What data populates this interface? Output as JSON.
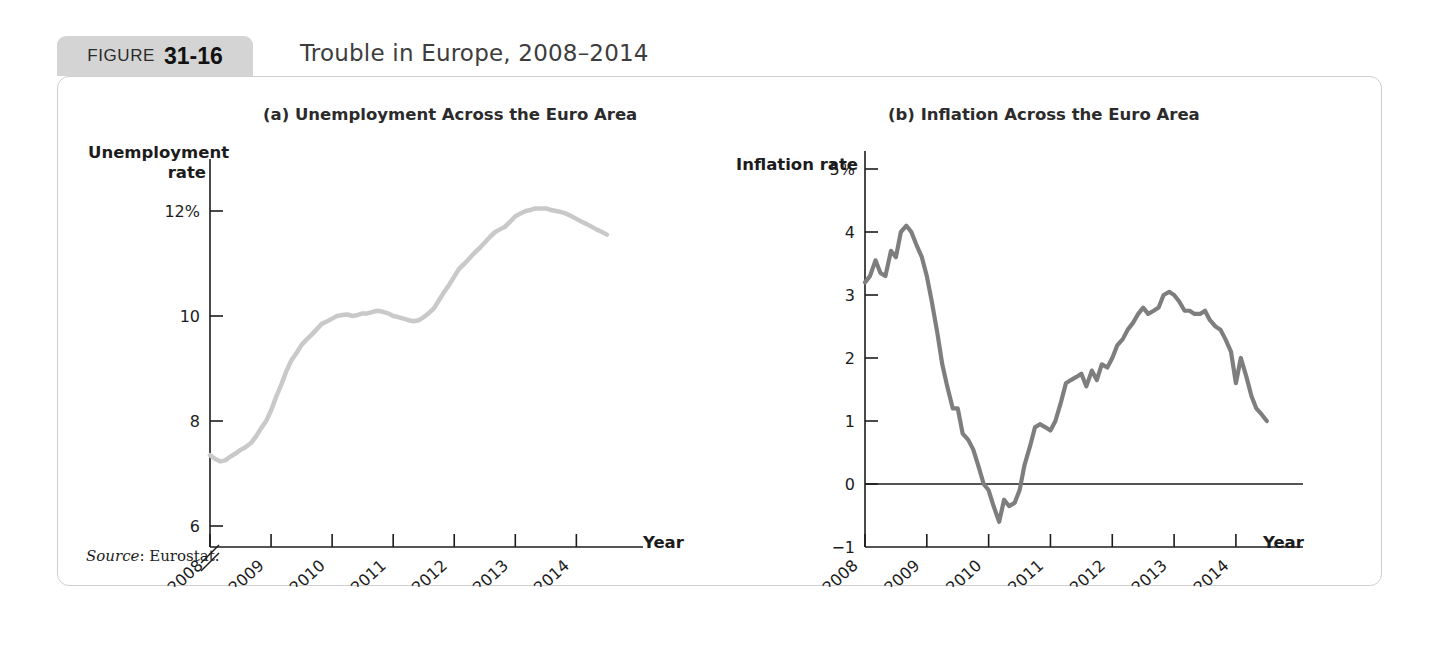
{
  "figure": {
    "badge_word": "FIGURE",
    "badge_number": "31-16",
    "title": "Trouble in Europe, 2008–2014",
    "source": "Source",
    "source_text": ": Eurostat."
  },
  "panels": {
    "a": {
      "title": "(a) Unemployment Across the Euro Area",
      "ylabel_line1": "Unemployment",
      "ylabel_line2": "rate",
      "xlabel": "Year"
    },
    "b": {
      "title": "(b) Inflation Across the Euro Area",
      "ylabel": "Inflation rate",
      "xlabel": "Year"
    }
  },
  "colors": {
    "unemployment_line": "#c9c9c9",
    "inflation_line": "#7e7e7e",
    "axis": "#1c1c1c",
    "badge_bg": "#d4d4d4",
    "card_border": "#cfcfcf"
  },
  "chart_data": [
    {
      "type": "line",
      "title": "(a) Unemployment Across the Euro Area",
      "xlabel": "Year",
      "ylabel": "Unemployment rate",
      "grid": false,
      "legend": "none",
      "y_axis_break": true,
      "ylim": [
        5.6,
        12.8
      ],
      "xlim": [
        2008.0,
        2014.6
      ],
      "yticks": [
        6,
        8,
        10,
        12
      ],
      "ytick_labels": [
        "6",
        "8",
        "10",
        "12%"
      ],
      "xticks": [
        2008,
        2009,
        2010,
        2011,
        2012,
        2013,
        2014
      ],
      "xtick_labels": [
        "2008",
        "2009",
        "2010",
        "2011",
        "2012",
        "2013",
        "2014"
      ],
      "series": [
        {
          "name": "Euro area unemployment rate",
          "color": "#c9c9c9",
          "x": [
            2008.0,
            2008.08,
            2008.17,
            2008.25,
            2008.33,
            2008.42,
            2008.5,
            2008.58,
            2008.67,
            2008.75,
            2008.83,
            2008.92,
            2009.0,
            2009.08,
            2009.17,
            2009.25,
            2009.33,
            2009.42,
            2009.5,
            2009.58,
            2009.67,
            2009.75,
            2009.83,
            2009.92,
            2010.0,
            2010.08,
            2010.17,
            2010.25,
            2010.33,
            2010.42,
            2010.5,
            2010.58,
            2010.67,
            2010.75,
            2010.83,
            2010.92,
            2011.0,
            2011.08,
            2011.17,
            2011.25,
            2011.33,
            2011.42,
            2011.5,
            2011.58,
            2011.67,
            2011.75,
            2011.83,
            2011.92,
            2012.0,
            2012.08,
            2012.17,
            2012.25,
            2012.33,
            2012.42,
            2012.5,
            2012.58,
            2012.67,
            2012.75,
            2012.83,
            2012.92,
            2013.0,
            2013.08,
            2013.17,
            2013.25,
            2013.33,
            2013.42,
            2013.5,
            2013.58,
            2013.67,
            2013.75,
            2013.83,
            2013.92,
            2014.0,
            2014.08,
            2014.17,
            2014.25,
            2014.33,
            2014.42,
            2014.5
          ],
          "y": [
            7.35,
            7.28,
            7.23,
            7.25,
            7.32,
            7.38,
            7.45,
            7.5,
            7.58,
            7.7,
            7.85,
            8.0,
            8.2,
            8.45,
            8.7,
            8.95,
            9.15,
            9.3,
            9.45,
            9.55,
            9.65,
            9.75,
            9.85,
            9.9,
            9.95,
            10.0,
            10.02,
            10.03,
            10.0,
            10.02,
            10.05,
            10.05,
            10.08,
            10.1,
            10.08,
            10.05,
            10.0,
            9.98,
            9.95,
            9.92,
            9.9,
            9.92,
            9.98,
            10.05,
            10.15,
            10.3,
            10.45,
            10.6,
            10.75,
            10.9,
            11.0,
            11.1,
            11.2,
            11.3,
            11.4,
            11.5,
            11.6,
            11.65,
            11.7,
            11.8,
            11.9,
            11.95,
            12.0,
            12.02,
            12.05,
            12.05,
            12.05,
            12.02,
            12.0,
            11.98,
            11.95,
            11.9,
            11.85,
            11.8,
            11.75,
            11.7,
            11.65,
            11.6,
            11.55
          ]
        }
      ]
    },
    {
      "type": "line",
      "title": "(b) Inflation Across the Euro Area",
      "xlabel": "Year",
      "ylabel": "Inflation rate",
      "grid": false,
      "legend": "none",
      "zero_line": true,
      "ylim": [
        -1.0,
        5.0
      ],
      "xlim": [
        2008.0,
        2014.6
      ],
      "yticks": [
        -1,
        0,
        1,
        2,
        3,
        4,
        5
      ],
      "ytick_labels": [
        "−1",
        "0",
        "1",
        "2",
        "3",
        "4",
        "5%"
      ],
      "xticks": [
        2008,
        2009,
        2010,
        2011,
        2012,
        2013,
        2014
      ],
      "xtick_labels": [
        "2008",
        "2009",
        "2010",
        "2011",
        "2012",
        "2013",
        "2014"
      ],
      "series": [
        {
          "name": "Euro area inflation rate",
          "color": "#7e7e7e",
          "x": [
            2008.0,
            2008.08,
            2008.17,
            2008.25,
            2008.33,
            2008.42,
            2008.5,
            2008.58,
            2008.67,
            2008.75,
            2008.83,
            2008.92,
            2009.0,
            2009.08,
            2009.17,
            2009.25,
            2009.33,
            2009.42,
            2009.5,
            2009.58,
            2009.67,
            2009.75,
            2009.83,
            2009.92,
            2010.0,
            2010.08,
            2010.17,
            2010.25,
            2010.33,
            2010.42,
            2010.5,
            2010.58,
            2010.67,
            2010.75,
            2010.83,
            2010.92,
            2011.0,
            2011.08,
            2011.17,
            2011.25,
            2011.33,
            2011.42,
            2011.5,
            2011.58,
            2011.67,
            2011.75,
            2011.83,
            2011.92,
            2012.0,
            2012.08,
            2012.17,
            2012.25,
            2012.33,
            2012.42,
            2012.5,
            2012.58,
            2012.67,
            2012.75,
            2012.83,
            2012.92,
            2013.0,
            2013.08,
            2013.17,
            2013.25,
            2013.33,
            2013.42,
            2013.5,
            2013.58,
            2013.67,
            2013.75,
            2013.83,
            2013.92,
            2014.0,
            2014.08,
            2014.17,
            2014.25,
            2014.33,
            2014.42,
            2014.5
          ],
          "y": [
            3.2,
            3.3,
            3.55,
            3.35,
            3.3,
            3.7,
            3.6,
            4.0,
            4.1,
            4.0,
            3.8,
            3.6,
            3.3,
            2.9,
            2.4,
            1.9,
            1.55,
            1.2,
            1.2,
            0.8,
            0.7,
            0.55,
            0.3,
            0.0,
            -0.1,
            -0.35,
            -0.6,
            -0.25,
            -0.35,
            -0.3,
            -0.1,
            0.3,
            0.6,
            0.9,
            0.95,
            0.9,
            0.85,
            1.0,
            1.3,
            1.6,
            1.65,
            1.7,
            1.75,
            1.55,
            1.8,
            1.65,
            1.9,
            1.85,
            2.0,
            2.2,
            2.3,
            2.45,
            2.55,
            2.7,
            2.8,
            2.7,
            2.75,
            2.8,
            3.0,
            3.05,
            3.0,
            2.9,
            2.75,
            2.75,
            2.7,
            2.7,
            2.75,
            2.6,
            2.5,
            2.45,
            2.3,
            2.1,
            1.6,
            2.0,
            1.7,
            1.4,
            1.2,
            1.1,
            1.0
          ]
        }
      ]
    }
  ]
}
